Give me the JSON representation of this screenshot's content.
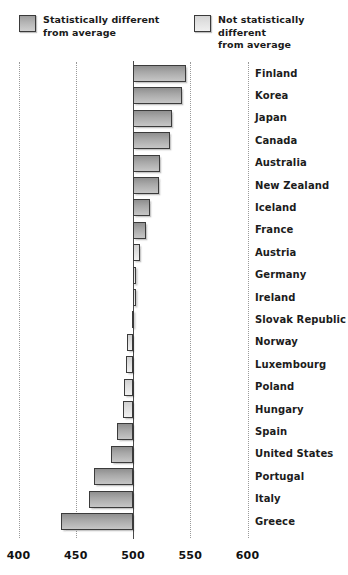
{
  "legend": {
    "items": [
      {
        "id": "statistically-different",
        "label": "Statistically different\nfrom average",
        "swatch": "dark",
        "color": "#a8a8a8"
      },
      {
        "id": "not-statistically-different",
        "label": "Not statistically different\nfrom average",
        "swatch": "light",
        "color": "#dedede"
      }
    ]
  },
  "axis": {
    "ticks": [
      400,
      450,
      500,
      550,
      600
    ],
    "tick_labels": [
      "400",
      "450",
      "500",
      "550",
      "600"
    ],
    "baseline": 500,
    "min": 390,
    "max": 610
  },
  "chart_data": {
    "type": "bar",
    "orientation": "horizontal",
    "title": "",
    "subtitle": "",
    "xlabel": "",
    "ylabel": "",
    "xlim": [
      390,
      610
    ],
    "baseline": 500,
    "grid": true,
    "gridlines": [
      400,
      450,
      500,
      550,
      600
    ],
    "legend_position": "top",
    "categories": [
      "Finland",
      "Korea",
      "Japan",
      "Canada",
      "Australia",
      "New Zealand",
      "Iceland",
      "France",
      "Austria",
      "Germany",
      "Ireland",
      "Slovak Republic",
      "Norway",
      "Luxembourg",
      "Poland",
      "Hungary",
      "Spain",
      "United States",
      "Portugal",
      "Italy",
      "Greece"
    ],
    "values": [
      546,
      543,
      534,
      532,
      524,
      523,
      515,
      511,
      506,
      503,
      503,
      499,
      495,
      494,
      492,
      491,
      486,
      481,
      466,
      462,
      437
    ],
    "series": [
      {
        "name": "Mean score",
        "values": [
          546,
          543,
          534,
          532,
          524,
          523,
          515,
          511,
          506,
          503,
          503,
          499,
          495,
          494,
          492,
          491,
          486,
          481,
          466,
          462,
          437
        ]
      }
    ],
    "significance": [
      "different",
      "different",
      "different",
      "different",
      "different",
      "different",
      "different",
      "different",
      "not-different",
      "not-different",
      "not-different",
      "not-different",
      "not-different",
      "not-different",
      "not-different",
      "not-different",
      "different",
      "different",
      "different",
      "different",
      "different"
    ]
  }
}
